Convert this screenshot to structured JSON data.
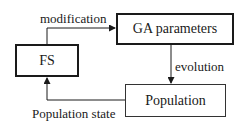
{
  "diagram": {
    "nodes": [
      {
        "id": "fs",
        "label": "FS"
      },
      {
        "id": "ga",
        "label": "GA parameters"
      },
      {
        "id": "pop",
        "label": "Population"
      }
    ],
    "edges": [
      {
        "from": "fs",
        "to": "ga",
        "label": "modification"
      },
      {
        "from": "ga",
        "to": "pop",
        "label": "evolution"
      },
      {
        "from": "pop",
        "to": "fs",
        "label": "Population state"
      }
    ]
  },
  "colors": {
    "stroke": "#1a1a1a",
    "background": "#ffffff"
  }
}
